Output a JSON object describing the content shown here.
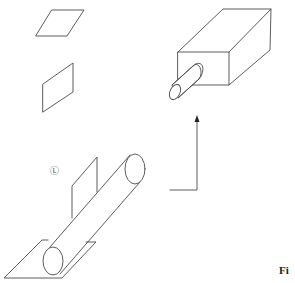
{
  "figure": {
    "caption_fragment": "Fi",
    "circled_symbol": "Ⓛ",
    "elements": [
      {
        "name": "horizontal-parallelogram",
        "points": [
          [
            36,
            36
          ],
          [
            67,
            36
          ],
          [
            84,
            10
          ],
          [
            52,
            10
          ]
        ]
      },
      {
        "name": "vertical-parallelogram",
        "points": [
          [
            43,
            84
          ],
          [
            73,
            63
          ],
          [
            73,
            92
          ],
          [
            43,
            112
          ]
        ]
      },
      {
        "name": "rectangular-box",
        "front": [
          [
            178,
            52
          ],
          [
            229,
            52
          ],
          [
            229,
            85
          ],
          [
            178,
            85
          ]
        ],
        "back_top": [
          [
            223,
            9
          ],
          [
            271,
            9
          ]
        ],
        "back_bottom_right": [
          270,
          50
        ]
      },
      {
        "name": "small-cylinder",
        "front_ellipse": {
          "cx": 175,
          "cy": 92,
          "rx": 5,
          "ry": 8
        }
      },
      {
        "name": "direction-arrow",
        "corner": [
          197,
          190
        ],
        "tip": [
          197,
          117
        ],
        "tail": [
          170,
          190
        ]
      },
      {
        "name": "large-cylinder",
        "upper_ellipse": {
          "cx": 135,
          "cy": 169,
          "rx": 10,
          "ry": 15
        },
        "lower_ellipse": {
          "cx": 53,
          "cy": 261,
          "rx": 10,
          "ry": 14
        }
      },
      {
        "name": "vertical-plane"
      },
      {
        "name": "ground-plane"
      }
    ],
    "stroke_color": "#4a4a4a",
    "background": "#ffffff"
  }
}
